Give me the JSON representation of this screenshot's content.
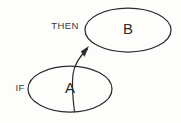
{
  "diagram": {
    "type": "rule-diagram",
    "background_color": "#fdfdfc",
    "stroke_color": "#2b2b2b",
    "text_color": "#2a2a2a",
    "nodes": [
      {
        "id": "node-b",
        "label": "B",
        "shape": "ellipse",
        "cx": 128,
        "cy": 30,
        "rx": 43,
        "ry": 22
      },
      {
        "id": "node-a",
        "label": "A",
        "shape": "ellipse",
        "cx": 70,
        "cy": 89,
        "rx": 42,
        "ry": 23
      }
    ],
    "edges": [
      {
        "id": "edge-a-to-b",
        "from": "node-a",
        "to": "node-b",
        "label": "THEN",
        "arrow": "to-target",
        "style": "curved"
      }
    ],
    "labels": [
      {
        "id": "label-if",
        "text": "IF",
        "x": 20,
        "y": 88
      },
      {
        "id": "label-then",
        "text": "THEN",
        "x": 65,
        "y": 26
      }
    ]
  }
}
